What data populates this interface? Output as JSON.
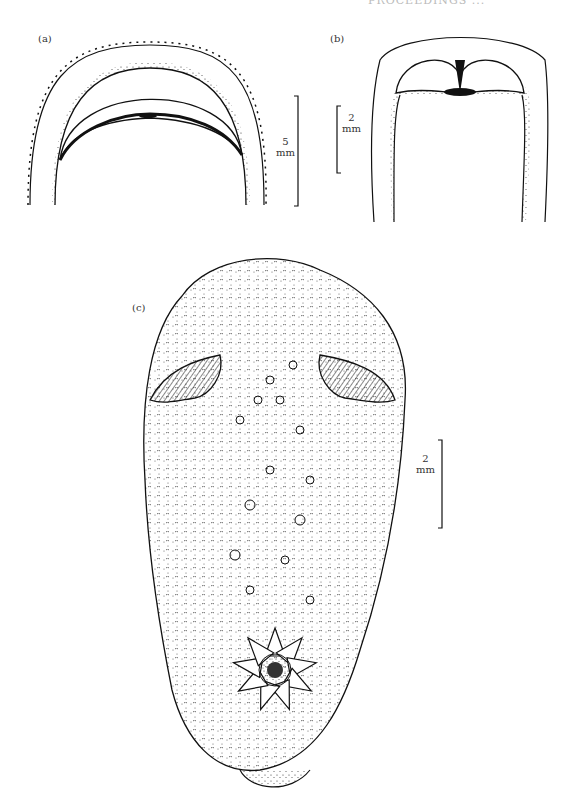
{
  "page": {
    "running_header": "PROCEEDINGS ...",
    "figure": {
      "panels": [
        {
          "id": "a",
          "label": "(a)",
          "scale_value": "5",
          "scale_unit": "mm"
        },
        {
          "id": "b",
          "label": "(b)",
          "scale_value": "2",
          "scale_unit": "mm"
        },
        {
          "id": "c",
          "label": "(c)",
          "scale_value": "2",
          "scale_unit": "mm"
        }
      ]
    }
  }
}
